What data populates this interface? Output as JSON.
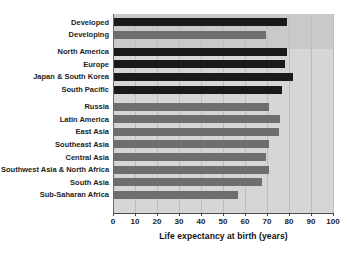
{
  "chart_data": {
    "type": "bar",
    "orientation": "horizontal",
    "title": "",
    "xlabel": "Life expectancy at birth (years)",
    "ylabel": "",
    "xlim": [
      0,
      100
    ],
    "xticks": [
      0,
      10,
      20,
      30,
      40,
      50,
      60,
      70,
      80,
      90,
      100
    ],
    "xtick_labels": [
      "0",
      "10",
      "20",
      "30",
      "40",
      "50",
      "60",
      "70",
      "80",
      "90",
      "100"
    ],
    "grid": true,
    "legend": "none",
    "categories": [
      "Developed",
      "Developing",
      "North America",
      "Europe",
      "Japan & South Korea",
      "South Pacific",
      "Russia",
      "Latin America",
      "East Asia",
      "Southeast Asia",
      "Central Asia",
      "Southwest Asia & North Africa",
      "South Asia",
      "Sub-Saharan Africa"
    ],
    "values": [
      79,
      69.5,
      79,
      78,
      82,
      77,
      71,
      76,
      75.5,
      71,
      69.5,
      71,
      67.5,
      57
    ],
    "bar_styles": [
      "dark",
      "light",
      "dark",
      "dark",
      "dark",
      "dark",
      "light",
      "light",
      "light",
      "light",
      "light",
      "light",
      "light",
      "light"
    ],
    "groups": [
      {
        "name": "aggregate",
        "categories": [
          "Developed",
          "Developing"
        ]
      },
      {
        "name": "developed-regions",
        "categories": [
          "North America",
          "Europe",
          "Japan & South Korea",
          "South Pacific"
        ]
      },
      {
        "name": "developing-regions",
        "categories": [
          "Russia",
          "Latin America",
          "East Asia",
          "Southeast Asia",
          "Central Asia",
          "Southwest Asia & North Africa",
          "South Asia",
          "Sub-Saharan Africa"
        ]
      }
    ],
    "colors": {
      "dark_bar": "#1a1a1a",
      "light_bar": "#6e6e6e",
      "plot_background": "#d6d6d6",
      "aggregate_band_background": "#c9c9c9",
      "gridline": "#bdbdbd",
      "axis": "#4a4a4a",
      "text": "#1d1d1d",
      "page_background": "#ffffff"
    }
  }
}
